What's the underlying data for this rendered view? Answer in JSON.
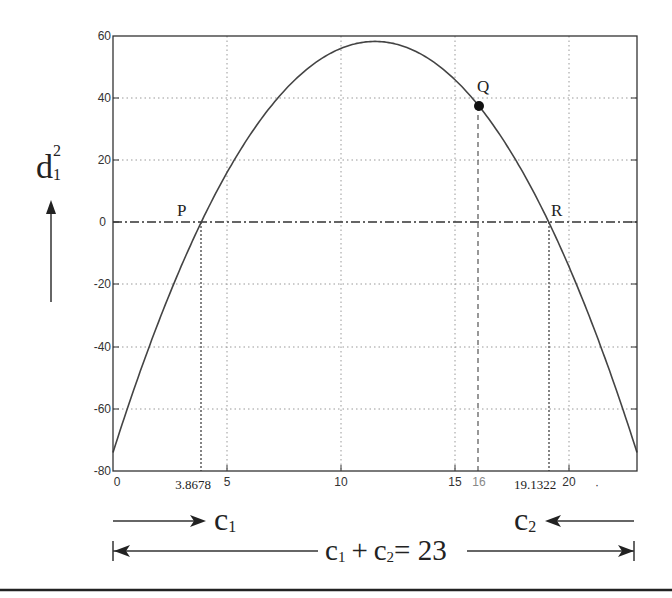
{
  "chart_data": {
    "type": "line",
    "title": "",
    "xlabel": "",
    "ylabel": "d1^2",
    "xlim": [
      0,
      23
    ],
    "ylim": [
      -80,
      60
    ],
    "grid": true,
    "x_ticks": [
      "0",
      "5",
      "10",
      "15",
      "20"
    ],
    "y_ticks": [
      "60",
      "40",
      "20",
      "0",
      "-20",
      "-40",
      "-60",
      "-80"
    ],
    "series": [
      {
        "name": "d1^2 vs c1",
        "formula": "-(x-3.8678)(x-19.1322)",
        "x": [
          0,
          2,
          3.8678,
          6,
          8,
          10,
          11.5,
          13,
          15,
          16,
          17,
          19.1322,
          21,
          23
        ],
        "y": [
          -74.0,
          -32.3,
          0.0,
          28.3,
          42.5,
          54.8,
          58.25,
          54.8,
          43.9,
          38.0,
          28.3,
          0.0,
          -32.3,
          -74.0
        ]
      }
    ],
    "points": [
      {
        "label": "P",
        "x": 3.8678,
        "y": 0
      },
      {
        "label": "Q",
        "x": 16,
        "y": 38
      },
      {
        "label": "R",
        "x": 19.1322,
        "y": 0
      }
    ],
    "annotations": {
      "x_marks": [
        "3.8678",
        "16",
        "19.1322"
      ],
      "dot_label": "·"
    }
  },
  "labels": {
    "ylabel_main": "d",
    "ylabel_sub": "1",
    "ylabel_sup": "2",
    "point_p": "P",
    "point_q": "Q",
    "point_r": "R",
    "c1_main": "c",
    "c1_sub": "1",
    "c2_main": "c",
    "c2_sub": "2",
    "sum_c1": "c",
    "sum_c1_sub": "1",
    "sum_plus": "+",
    "sum_c2": "c",
    "sum_c2_sub": "2",
    "sum_eq": "= 23"
  },
  "ticks": {
    "x": {
      "t0": "0",
      "t5": "5",
      "t10": "10",
      "t15": "15",
      "t20": "20",
      "m1": "3.8678",
      "m2": "16",
      "m3": "19.1322",
      "dot": "·"
    },
    "y": {
      "t60": "60",
      "t40": "40",
      "t20": "20",
      "t0": "0",
      "tm20": "-20",
      "tm40": "-40",
      "tm60": "-60",
      "tm80": "-80"
    }
  }
}
